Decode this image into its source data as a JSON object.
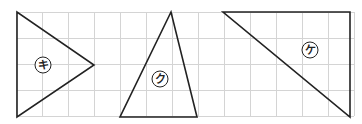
{
  "figure": {
    "grid": {
      "x_start": 16,
      "y_start": 12,
      "cell": 26,
      "cols": 13,
      "rows": 4,
      "color": "#d4d4d4"
    },
    "shapes": [
      {
        "id": "ki",
        "label": "キ",
        "points": "17,12 17,117 94,65",
        "label_pos": [
          43,
          65
        ]
      },
      {
        "id": "ku",
        "label": "ク",
        "points": "171,12 120,117 197,117",
        "label_pos": [
          160,
          79
        ]
      },
      {
        "id": "ke",
        "label": "ケ",
        "points": "223,12 350,12 350,117",
        "label_pos": [
          310,
          50
        ]
      }
    ],
    "stroke_color": "#222222"
  }
}
